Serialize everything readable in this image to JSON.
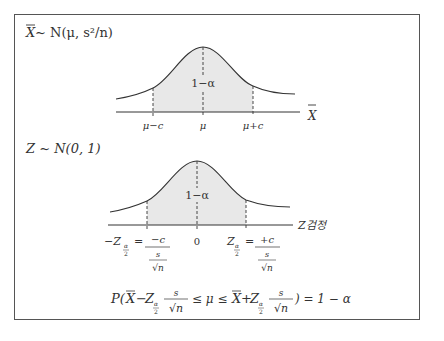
{
  "top_panel": {
    "title_var": "X",
    "title_rest": " ~ N(μ, s²/n)",
    "area_label": "1−α",
    "tick_labels": [
      "μ−c",
      "μ",
      "μ+c"
    ],
    "axis_label": "X"
  },
  "bottom_panel": {
    "title": "Z ~ N(0, 1)",
    "area_label": "1−α",
    "axis_label": "Z검정",
    "center_tick": "0",
    "left_z": "−Z",
    "right_z": "Z",
    "subscript_num": "α",
    "subscript_den": "2",
    "equals": "=",
    "left_num": "−c",
    "right_num": "+c",
    "frac_num": "s",
    "frac_den": "√n"
  },
  "formula": {
    "p_open": "P(",
    "xbar": "X",
    "minus": "−",
    "z": "Z",
    "s": "s",
    "sqrtn": "√n",
    "leq_mu_leq": "≤ μ ≤",
    "plus": "+",
    "close_eq": ") = 1 − α"
  },
  "colors": {
    "shade": "#e8e8e8",
    "line": "#333333",
    "border": "#555555"
  }
}
